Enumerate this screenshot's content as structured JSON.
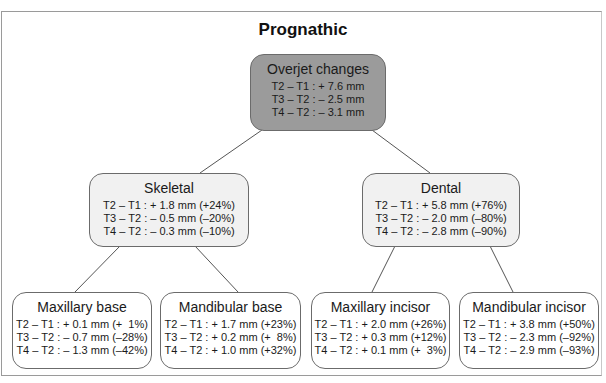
{
  "title": "Prognathic",
  "root": {
    "name": "Overjet changes",
    "lines": [
      "T2 – T1 : + 7.6 mm",
      "T3 – T2 : – 2.5 mm",
      "T4 – T2 : – 3.1 mm"
    ]
  },
  "skeletal": {
    "name": "Skeletal",
    "lines": [
      "T2 – T1 : + 1.8 mm (+24%)",
      "T3 – T2 : – 0.5 mm (–20%)",
      "T4 – T2 : – 0.3 mm (–10%)"
    ]
  },
  "dental": {
    "name": "Dental",
    "lines": [
      "T2 – T1 : + 5.8 mm (+76%)",
      "T3 – T2 : – 2.0 mm (–80%)",
      "T4 – T2 : – 2.8 mm (–90%)"
    ]
  },
  "maxillary_base": {
    "name": "Maxillary base",
    "lines": [
      "T2 – T1 : + 0.1 mm (+  1%)",
      "T3 – T2 : – 0.7 mm (–28%)",
      "T4 – T2 : – 1.3 mm (–42%)"
    ]
  },
  "mandibular_base": {
    "name": "Mandibular base",
    "lines": [
      "T2 – T1 : + 1.7 mm (+23%)",
      "T3 – T2 : + 0.2 mm (+  8%)",
      "T4 – T2 : + 1.0 mm (+32%)"
    ]
  },
  "maxillary_incisor": {
    "name": "Maxillary incisor",
    "lines": [
      "T2 – T1 : + 2.0 mm (+26%)",
      "T3 – T2 : + 0.3 mm (+12%)",
      "T4 – T2 : + 0.1 mm (+  3%)"
    ]
  },
  "mandibular_incisor": {
    "name": "Mandibular incisor",
    "lines": [
      "T2 – T1 : + 3.8 mm (+50%)",
      "T3 – T2 : – 2.3 mm (–92%)",
      "T4 – T2 : – 2.9 mm (–93%)"
    ]
  }
}
